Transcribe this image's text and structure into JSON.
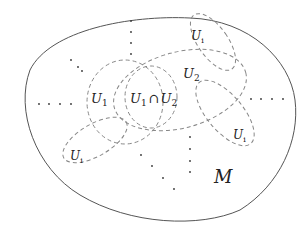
{
  "diagram": {
    "manifold_label": "M",
    "labels": {
      "u1": {
        "main": "U",
        "sub": "1"
      },
      "u2": {
        "main": "U",
        "sub": "2"
      },
      "intersection": {
        "a": "U",
        "a_sub": "1",
        "op": "∩",
        "b": "U",
        "b_sub": "2"
      },
      "ui_top": {
        "main": "U",
        "sub": "i"
      },
      "ui_right": {
        "main": "U",
        "sub": "i"
      },
      "ui_left": {
        "main": "U",
        "sub": "i"
      }
    },
    "colors": {
      "outline": "#555555",
      "dashed": "#888888",
      "dots": "#333333",
      "text": "#222222"
    }
  }
}
